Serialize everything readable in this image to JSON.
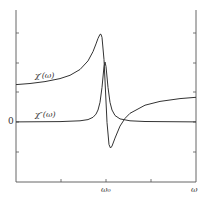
{
  "chart_data": {
    "type": "line",
    "title": "",
    "xlabel": "ω",
    "ylabel": "",
    "x_ticks": [
      {
        "label": "",
        "pos": 61
      },
      {
        "label": "ω₀",
        "pos": 106
      },
      {
        "label": "",
        "pos": 151
      }
    ],
    "y_ticks": [
      {
        "label": "",
        "pos": 33
      },
      {
        "label": "",
        "pos": 63
      },
      {
        "label": "",
        "pos": 92
      },
      {
        "label": "0",
        "pos": 122
      },
      {
        "label": "",
        "pos": 152
      }
    ],
    "zero_label": "0",
    "x_axis_label": "ω",
    "x_center_label": "ω₀",
    "grid": false,
    "legend": "inline labels",
    "series": [
      {
        "name": "χ'(ω)",
        "label": "χ′(ω)",
        "kind": "dispersion",
        "x": [
          16,
          30,
          45,
          60,
          70,
          80,
          88,
          93,
          96,
          98,
          100,
          101,
          102,
          104,
          105.5,
          107,
          109,
          110.5,
          112,
          115,
          120,
          125,
          130,
          145,
          160,
          180,
          196
        ],
        "y_px": [
          84.6,
          83.5,
          81.6,
          78.6,
          75.3,
          69.5,
          60.9,
          51.6,
          43.9,
          38.4,
          34.3,
          34.3,
          37.4,
          59.6,
          91,
          122.4,
          144.6,
          148,
          146.1,
          138.1,
          126.1,
          118.4,
          113.3,
          105.2,
          101.4,
          98.6,
          97.3
        ]
      },
      {
        "name": "χ''(ω)",
        "label": "χ″(ω)",
        "kind": "absorption",
        "x": [
          16,
          60,
          80,
          88,
          93,
          96,
          98,
          100,
          102,
          104,
          105,
          106,
          108,
          110,
          112,
          115,
          120,
          130,
          145,
          196
        ],
        "y_px": [
          121.9,
          121.6,
          120.8,
          119.6,
          117.3,
          114.1,
          110,
          102.3,
          87.4,
          66.5,
          62,
          66.5,
          87.4,
          102.3,
          110,
          115.5,
          118.9,
          120.8,
          121.5,
          121.9
        ]
      }
    ],
    "plot_box": {
      "left": 16,
      "right": 196,
      "top": 10,
      "bottom": 182
    },
    "baseline_y_px": 122
  },
  "labels": {
    "chi_prime": "χ′(ω)",
    "chi_double_prime": "χ″(ω)",
    "zero": "0",
    "omega0": "ω₀",
    "omega": "ω"
  }
}
